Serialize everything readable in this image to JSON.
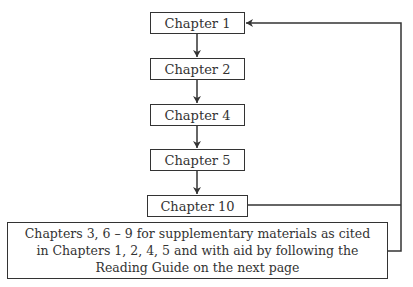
{
  "diagram": {
    "nodes": [
      {
        "id": "ch1",
        "label": "Chapter 1"
      },
      {
        "id": "ch2",
        "label": "Chapter 2"
      },
      {
        "id": "ch4",
        "label": "Chapter 4"
      },
      {
        "id": "ch5",
        "label": "Chapter 5"
      },
      {
        "id": "ch10",
        "label": "Chapter 10"
      }
    ],
    "supplementary": {
      "lines": [
        "Chapters 3, 6 – 9 for supplementary materials as cited",
        "in Chapters 1, 2, 4, 5 and with aid by following the",
        "Reading Guide on the next page"
      ]
    },
    "edges": [
      {
        "from": "ch1",
        "to": "ch2"
      },
      {
        "from": "ch2",
        "to": "ch4"
      },
      {
        "from": "ch4",
        "to": "ch5"
      },
      {
        "from": "ch5",
        "to": "ch10"
      },
      {
        "from": "ch10",
        "to": "ch1"
      },
      {
        "from": "supplementary",
        "to": "ch1"
      }
    ]
  }
}
